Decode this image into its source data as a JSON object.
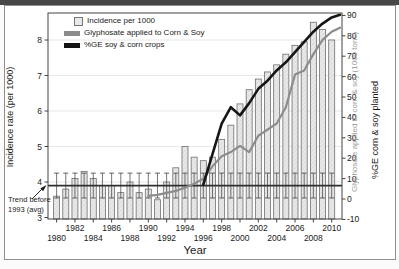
{
  "figure": {
    "legend": {
      "items": [
        {
          "label": "Incidence per 1000",
          "swatch": "incidence-bar"
        },
        {
          "label": "Glyphosate applied to Corn & Soy",
          "swatch": "glyphosate-line"
        },
        {
          "label": "%GE soy & corn crops",
          "swatch": "ge-line"
        }
      ]
    },
    "axis_labels": {
      "left": "Incidence rate (per 1000)",
      "right_glyphosate": "Glyphosate applied to corn & soy (1000 tons)",
      "right_ge": "%GE corn & soy planted",
      "x": "Year"
    },
    "annotation": {
      "line1": "Trend before",
      "line2": "1993 (avg)"
    }
  },
  "chart_data": {
    "type": "combo",
    "title": "",
    "x_years": [
      1980,
      1981,
      1982,
      1983,
      1984,
      1985,
      1986,
      1987,
      1988,
      1989,
      1990,
      1991,
      1992,
      1993,
      1994,
      1995,
      1996,
      1997,
      1998,
      1999,
      2000,
      2001,
      2002,
      2003,
      2004,
      2005,
      2006,
      2007,
      2008,
      2009,
      2010
    ],
    "series": [
      {
        "name": "Incidence per 1000",
        "type": "bar",
        "axis": "left",
        "x": [
          1980,
          1981,
          1982,
          1983,
          1984,
          1985,
          1986,
          1987,
          1988,
          1989,
          1990,
          1991,
          1992,
          1993,
          1994,
          1995,
          1996,
          1997,
          1998,
          1999,
          2000,
          2001,
          2002,
          2003,
          2004,
          2005,
          2006,
          2007,
          2008,
          2009,
          2010
        ],
        "values": [
          3.6,
          3.8,
          4.1,
          4.3,
          4.1,
          3.9,
          3.9,
          3.7,
          4.0,
          3.7,
          3.8,
          3.5,
          4.0,
          4.4,
          5.0,
          4.7,
          4.6,
          4.7,
          5.2,
          5.6,
          6.2,
          6.6,
          6.9,
          7.1,
          7.3,
          7.6,
          7.85,
          7.95,
          8.5,
          8.3,
          8.0
        ]
      },
      {
        "name": "Glyphosate applied to Corn & Soy",
        "type": "line",
        "axis": "right",
        "x": [
          1990,
          1991,
          1992,
          1993,
          1994,
          1995,
          1996,
          1997,
          1998,
          1999,
          2000,
          2001,
          2002,
          2003,
          2004,
          2005,
          2006,
          2007,
          2008,
          2009,
          2010
        ],
        "values": [
          1.5,
          2,
          3,
          4,
          5.5,
          7.5,
          10,
          16,
          21,
          23,
          26,
          23,
          31,
          34,
          37,
          45,
          61,
          63,
          71,
          78,
          82
        ],
        "end_extension_value": 84
      },
      {
        "name": "%GE soy & corn crops",
        "type": "line",
        "axis": "right",
        "x": [
          1996,
          1997,
          1998,
          1999,
          2000,
          2001,
          2002,
          2003,
          2004,
          2005,
          2006,
          2007,
          2008,
          2009,
          2010
        ],
        "values": [
          7,
          22,
          37,
          45,
          41,
          47,
          54,
          58,
          63,
          67,
          72,
          77,
          82,
          86,
          89
        ],
        "end_extension_value": 90.3
      }
    ],
    "trend_line": {
      "label": "Trend before 1993 (avg)",
      "value": 3.9,
      "whisker_low": 3.55,
      "whisker_high": 4.25
    },
    "axes": {
      "left": {
        "label": "Incidence rate (per 1000)",
        "min": 3,
        "max": 8.8,
        "ticks": [
          3,
          4,
          5,
          6,
          7,
          8
        ]
      },
      "right": {
        "label_gray": "Glyphosate applied to corn & soy (1000 tons)",
        "label_black": "%GE corn & soy planted",
        "min": -10,
        "max": 90,
        "ticks": [
          -10,
          0,
          10,
          20,
          30,
          40,
          50,
          60,
          70,
          80,
          90
        ]
      },
      "x": {
        "label": "Year",
        "tick_years": [
          1980,
          1982,
          1984,
          1986,
          1988,
          1990,
          1992,
          1994,
          1996,
          1998,
          2000,
          2002,
          2004,
          2006,
          2008,
          2010
        ]
      }
    },
    "grid": "horizontal-light",
    "legend_position": "top-left"
  },
  "colors": {
    "bar_fill": "#e9e9e9",
    "bar_hatch": "#cdcdcd",
    "bar_stroke": "#6e6e6e",
    "glyphosate_line": "#8c8c8c",
    "ge_line": "#161616",
    "trend_line": "#2f2f2f",
    "whisker": "#3c3c3c",
    "grid": "#dcdcdc",
    "axis": "#444444",
    "gray_axis_label": "#9a9a9a"
  }
}
